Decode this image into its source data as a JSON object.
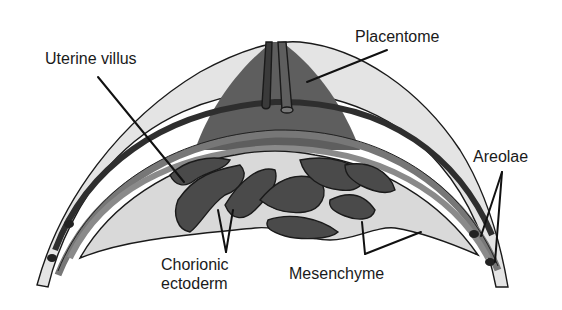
{
  "figure": {
    "type": "anatomical-diagram"
  },
  "labels": {
    "uterine_villus": "Uterine villus",
    "placentome": "Placentome",
    "areolae": "Areolae",
    "chorionic_ectoderm_line1": "Chorionic",
    "chorionic_ectoderm_line2": "ectoderm",
    "mesenchyme": "Mesenchyme"
  },
  "colors": {
    "background": "#ffffff",
    "outer_light": "#e4e4e4",
    "placentome_dark": "#5e5e5e",
    "band_dark": "#3a3a3a",
    "band_mid": "#7a7a7a",
    "mesenchyme_fill": "#d9d9d9",
    "villus_dark": "#4a4a4a",
    "outline": "#1a1a1a",
    "text": "#1a1a1a"
  }
}
